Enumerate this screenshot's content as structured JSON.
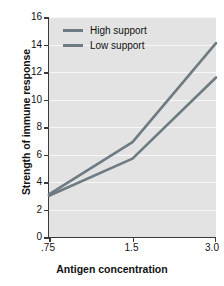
{
  "chart_data": {
    "type": "line",
    "title": "",
    "xlabel": "Antigen concentration",
    "ylabel": "Strength of immune response",
    "x": [
      ".75",
      "1.5",
      "3.0"
    ],
    "categories": [
      ".75",
      "1.5",
      "3.0"
    ],
    "xtick_labels": [
      ".75",
      "1.5",
      "3.0"
    ],
    "ytick_labels": [
      "0",
      "2",
      "4",
      "6",
      "8",
      "10",
      "12",
      "14",
      "16"
    ],
    "ytick_values": [
      0,
      2,
      4,
      6,
      8,
      10,
      12,
      14,
      16
    ],
    "ylim": [
      0,
      16
    ],
    "grid": "horizontal",
    "legend_position": "top-left-inside",
    "series": [
      {
        "name": "High support",
        "values": [
          3.1,
          6.9,
          14.1
        ],
        "color": "#6e7b82"
      },
      {
        "name": "Low support",
        "values": [
          3.0,
          5.7,
          11.6
        ],
        "color": "#6e7b82"
      }
    ]
  },
  "axes": {
    "y_title": "Strength of immune response",
    "x_title": "Antigen concentration",
    "y_ticks": [
      "0",
      "2",
      "4",
      "6",
      "8",
      "10",
      "12",
      "14",
      "16"
    ],
    "x_ticks": [
      ".75",
      "1.5",
      "3.0"
    ]
  },
  "legend": {
    "items": [
      {
        "label": "High support",
        "color": "#6e7b82"
      },
      {
        "label": "Low support",
        "color": "#6e7b82"
      }
    ]
  },
  "colors": {
    "plot_background": "#e3e3e3",
    "gridline": "#f7f7f7",
    "axis": "#3a3a3a",
    "text": "#111111",
    "series_line": "#6e7b82",
    "page_background": "#ffffff"
  }
}
